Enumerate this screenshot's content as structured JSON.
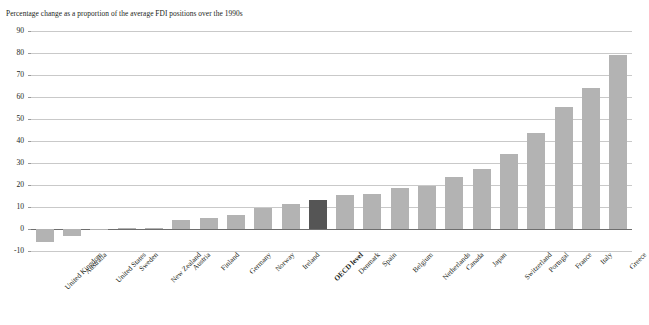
{
  "chart_data": {
    "type": "bar",
    "title": "",
    "subtitle": "Percentage change as a proportion of the average FDI positions over the 1990s",
    "xlabel": "",
    "ylabel": "",
    "ylim": [
      -10,
      90
    ],
    "yticks": [
      -10,
      0,
      10,
      20,
      30,
      40,
      50,
      60,
      70,
      80,
      90
    ],
    "ytick_labels": [
      "-10",
      "0",
      "10",
      "20",
      "30",
      "40",
      "50",
      "60",
      "70",
      "80",
      "90"
    ],
    "grid": true,
    "legend": "none",
    "bar_color": "#b3b3b3",
    "highlight_color": "#555555",
    "highlight_category": "OECD level",
    "categories": [
      "United Kingdom",
      "Australia",
      "United States",
      "Sweden",
      "New Zealand",
      "Austria",
      "Finland",
      "Germany",
      "Norway",
      "Ireland",
      "OECD level",
      "Denmark",
      "Spain",
      "Belgium",
      "Netherlands",
      "Canada",
      "Japan",
      "Switzerland",
      "Portugal",
      "France",
      "Italy",
      "Greece"
    ],
    "values": [
      -6.0,
      -3.0,
      0.0,
      0.5,
      0.5,
      4.0,
      5.0,
      6.5,
      9.5,
      11.5,
      13.0,
      15.5,
      16.0,
      18.5,
      19.5,
      23.5,
      27.5,
      34.0,
      43.5,
      55.5,
      64.0,
      79.0
    ]
  }
}
